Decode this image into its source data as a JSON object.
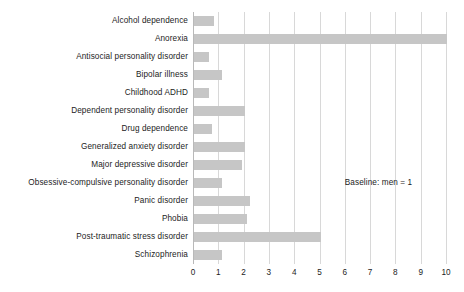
{
  "chart_data": {
    "type": "bar",
    "orientation": "horizontal",
    "title": "",
    "xlabel": "",
    "ylabel": "",
    "xlim": [
      0,
      10
    ],
    "xticks": [
      "0",
      "1",
      "2",
      "3",
      "4",
      "5",
      "6",
      "7",
      "8",
      "9",
      "10"
    ],
    "grid": "vertical",
    "legend": "none",
    "bar_color": "#c6c6c6",
    "gridline_color": "#d8d8d8",
    "axis_color": "#b9b9b9",
    "text_color": "#1c1c1c",
    "annotations": [
      {
        "text": "Baseline: men = 1",
        "x": 6.0,
        "y_index": 9
      }
    ],
    "categories": [
      "Alcohol dependence",
      "Anorexia",
      "Antisocial personality disorder",
      "Bipolar illness",
      "Childhood ADHD",
      "Dependent personality disorder",
      "Drug dependence",
      "Generalized anxiety disorder",
      "Major depressive disorder",
      "Obsessive-compulsive personality disorder",
      "Panic disorder",
      "Phobia",
      "Post-traumatic stress disorder",
      "Schizophrenia"
    ],
    "values": [
      0.8,
      10.0,
      0.6,
      1.1,
      0.6,
      2.0,
      0.7,
      2.0,
      1.9,
      1.1,
      2.2,
      2.1,
      5.0,
      1.1
    ]
  }
}
